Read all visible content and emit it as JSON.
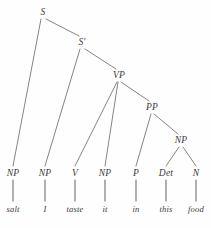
{
  "diagram": {
    "type": "syntax-tree",
    "sentence": "salt I taste in this food",
    "background_color": "#fefefe",
    "line_color": "#6e6e6e",
    "text_color": "#3a3a3a",
    "nodes": [
      {
        "id": "S",
        "label": "S",
        "x": 43,
        "y": 12
      },
      {
        "id": "Sbar",
        "label": "S'",
        "x": 82,
        "y": 42
      },
      {
        "id": "VP",
        "label": "VP",
        "x": 119,
        "y": 75
      },
      {
        "id": "PP",
        "label": "PP",
        "x": 152,
        "y": 107
      },
      {
        "id": "NPobj",
        "label": "NP",
        "x": 181,
        "y": 140
      },
      {
        "id": "NP1",
        "label": "NP",
        "x": 13,
        "y": 173
      },
      {
        "id": "NP2",
        "label": "NP",
        "x": 45,
        "y": 173
      },
      {
        "id": "V",
        "label": "V",
        "x": 75,
        "y": 173
      },
      {
        "id": "NP3",
        "label": "NP",
        "x": 105,
        "y": 173
      },
      {
        "id": "P",
        "label": "P",
        "x": 136,
        "y": 173
      },
      {
        "id": "Det",
        "label": "Det",
        "x": 166,
        "y": 173
      },
      {
        "id": "N",
        "label": "N",
        "x": 196,
        "y": 173
      }
    ],
    "words": [
      {
        "id": "w-salt",
        "label": "salt",
        "x": 13,
        "y": 209
      },
      {
        "id": "w-i",
        "label": "I",
        "x": 45,
        "y": 209
      },
      {
        "id": "w-taste",
        "label": "taste",
        "x": 75,
        "y": 209
      },
      {
        "id": "w-it",
        "label": "it",
        "x": 105,
        "y": 209
      },
      {
        "id": "w-in",
        "label": "in",
        "x": 136,
        "y": 209
      },
      {
        "id": "w-this",
        "label": "this",
        "x": 166,
        "y": 209
      },
      {
        "id": "w-food",
        "label": "food",
        "x": 196,
        "y": 209
      }
    ],
    "branches": [
      {
        "name": "branch-s-to-np-salt",
        "x1": 41,
        "y1": 19,
        "x2": 13,
        "y2": 166
      },
      {
        "name": "branch-s-to-sbar",
        "x1": 46,
        "y1": 19,
        "x2": 79,
        "y2": 36
      },
      {
        "name": "branch-sbar-to-np-i",
        "x1": 80,
        "y1": 49,
        "x2": 45,
        "y2": 166
      },
      {
        "name": "branch-sbar-to-vp",
        "x1": 85,
        "y1": 49,
        "x2": 116,
        "y2": 69
      },
      {
        "name": "branch-vp-to-v",
        "x1": 117,
        "y1": 82,
        "x2": 75,
        "y2": 166
      },
      {
        "name": "branch-vp-to-np-it",
        "x1": 118,
        "y1": 82,
        "x2": 105,
        "y2": 166
      },
      {
        "name": "branch-vp-to-pp",
        "x1": 121,
        "y1": 82,
        "x2": 149,
        "y2": 101
      },
      {
        "name": "branch-pp-to-p",
        "x1": 151,
        "y1": 114,
        "x2": 136,
        "y2": 166
      },
      {
        "name": "branch-pp-to-np",
        "x1": 154,
        "y1": 114,
        "x2": 178,
        "y2": 134
      },
      {
        "name": "branch-np-to-det",
        "x1": 179,
        "y1": 147,
        "x2": 166,
        "y2": 166
      },
      {
        "name": "branch-np-to-n",
        "x1": 183,
        "y1": 147,
        "x2": 196,
        "y2": 166
      }
    ],
    "stems": [
      {
        "name": "stem-np-salt",
        "x1": 13,
        "y1": 180,
        "x2": 13,
        "y2": 201
      },
      {
        "name": "stem-np-i",
        "x1": 45,
        "y1": 180,
        "x2": 45,
        "y2": 201
      },
      {
        "name": "stem-v-taste",
        "x1": 75,
        "y1": 180,
        "x2": 75,
        "y2": 201
      },
      {
        "name": "stem-np-it",
        "x1": 105,
        "y1": 180,
        "x2": 105,
        "y2": 201
      },
      {
        "name": "stem-p-in",
        "x1": 136,
        "y1": 180,
        "x2": 136,
        "y2": 201
      },
      {
        "name": "stem-det-this",
        "x1": 166,
        "y1": 180,
        "x2": 166,
        "y2": 201
      },
      {
        "name": "stem-n-food",
        "x1": 196,
        "y1": 180,
        "x2": 196,
        "y2": 201
      }
    ]
  }
}
